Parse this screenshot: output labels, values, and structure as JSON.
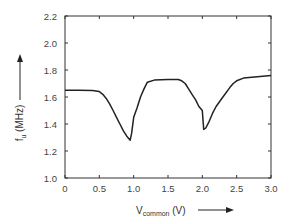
{
  "chart_data": {
    "type": "line",
    "title": "",
    "xlabel": "V_common (V)",
    "xlabel_main": "V",
    "xlabel_sub": "common",
    "xlabel_unit": " (V)",
    "ylabel": "f_u (MHz)",
    "ylabel_main": "f",
    "ylabel_sub": "u",
    "ylabel_unit": " (MHz)",
    "xlim": [
      0,
      3.0
    ],
    "ylim": [
      1.0,
      2.2
    ],
    "xticks": [
      "0",
      "0.5",
      "1.0",
      "1.5",
      "2.0",
      "2.5",
      "3.0"
    ],
    "yticks": [
      "1.0",
      "1.2",
      "1.4",
      "1.6",
      "1.8",
      "2.0",
      "2.2"
    ],
    "grid": false,
    "legend": null,
    "series": [
      {
        "name": "f_u",
        "color": "#222222",
        "x": [
          0.0,
          0.2,
          0.4,
          0.5,
          0.55,
          0.6,
          0.65,
          0.7,
          0.75,
          0.8,
          0.85,
          0.9,
          0.95,
          0.97,
          1.0,
          1.05,
          1.1,
          1.15,
          1.2,
          1.3,
          1.5,
          1.65,
          1.7,
          1.75,
          1.8,
          1.85,
          1.9,
          1.95,
          2.0,
          2.02,
          2.05,
          2.1,
          2.15,
          2.2,
          2.3,
          2.4,
          2.45,
          2.5,
          2.6,
          2.8,
          3.0
        ],
        "values": [
          1.65,
          1.65,
          1.648,
          1.64,
          1.62,
          1.59,
          1.55,
          1.5,
          1.45,
          1.4,
          1.35,
          1.31,
          1.28,
          1.33,
          1.45,
          1.52,
          1.6,
          1.66,
          1.71,
          1.725,
          1.73,
          1.73,
          1.72,
          1.7,
          1.66,
          1.62,
          1.58,
          1.53,
          1.5,
          1.36,
          1.37,
          1.42,
          1.48,
          1.53,
          1.6,
          1.67,
          1.7,
          1.72,
          1.74,
          1.75,
          1.76
        ]
      }
    ]
  },
  "annotations": {
    "y_arrow": "up-arrow",
    "x_arrow": "right-arrow"
  }
}
